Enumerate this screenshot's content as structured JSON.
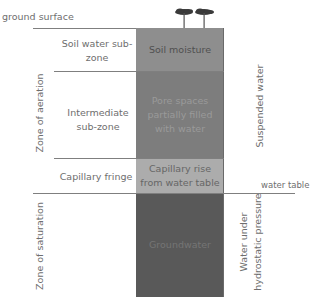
{
  "diagram": {
    "ground_surface_label": "ground surface",
    "water_table_label": "water table",
    "left_zones": {
      "aeration": "Zone of aeration",
      "saturation": "Zone of saturation"
    },
    "sub_zones": {
      "soil_water": "Soil water sub-zone",
      "intermediate": "Intermediate sub-zone",
      "capillary_fringe": "Capillary fringe"
    },
    "column_layers": {
      "soil_moisture": "Soil moisture",
      "pore_spaces": "Pore spaces partially filled with water",
      "capillary_rise": "Capillary rise from water table",
      "groundwater": "Groundwater"
    },
    "right_labels": {
      "suspended_water": "Suspended water",
      "hydrostatic_line1": "Water under",
      "hydrostatic_line2": "hydrostatic pressure"
    },
    "colors": {
      "soil_moisture": "#8e8e8e",
      "pore_spaces": "#7d7d7d",
      "capillary_rise": "#acacac",
      "groundwater": "#595959",
      "lines": "#7f7f7f",
      "text": "#6e6e6e"
    }
  }
}
